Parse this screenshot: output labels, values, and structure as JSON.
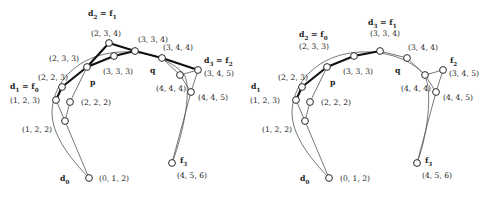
{
  "figure": {
    "title": "",
    "panels": [
      {
        "id": "left-panel",
        "name": "left-diagram",
        "origin_x": 0,
        "nodes": [
          {
            "id": "L-d0",
            "x": 89,
            "y": 178,
            "label": "(0, 1, 2)",
            "lx": 99,
            "ly": 175,
            "name": "node-0-1-2"
          },
          {
            "id": "L-122",
            "x": 65,
            "y": 121,
            "label": "(1, 2, 2)",
            "lx": 22,
            "ly": 126,
            "name": "node-1-2-2"
          },
          {
            "id": "L-d1",
            "x": 56,
            "y": 100,
            "label": "(1, 2, 3)",
            "lx": 10,
            "ly": 97,
            "name": "node-1-2-3"
          },
          {
            "id": "L-222",
            "x": 70,
            "y": 102,
            "label": "(2, 2, 2)",
            "lx": 81,
            "ly": 99,
            "name": "node-2-2-2"
          },
          {
            "id": "L-223",
            "x": 62,
            "y": 87,
            "label": "(2, 2, 3)",
            "lx": 38,
            "ly": 74,
            "name": "node-2-2-3"
          },
          {
            "id": "L-233",
            "x": 87,
            "y": 67,
            "label": "(2, 3, 3)",
            "lx": 49,
            "ly": 55,
            "name": "node-2-3-3"
          },
          {
            "id": "L-234",
            "x": 109,
            "y": 43,
            "label": "(2, 3, 4)",
            "lx": 91,
            "ly": 30,
            "name": "node-2-3-4"
          },
          {
            "id": "L-333",
            "x": 114,
            "y": 56,
            "label": "(3, 3, 3)",
            "lx": 103,
            "ly": 68,
            "name": "node-3-3-3"
          },
          {
            "id": "L-334",
            "x": 135,
            "y": 51,
            "label": "(3, 3, 4)",
            "lx": 138,
            "ly": 36,
            "name": "node-3-3-4"
          },
          {
            "id": "L-344",
            "x": 162,
            "y": 58,
            "label": "(3, 4, 4)",
            "lx": 163,
            "ly": 44,
            "name": "node-3-4-4"
          },
          {
            "id": "L-444",
            "x": 180,
            "y": 75,
            "label": "(4, 4, 4)",
            "lx": 156,
            "ly": 85,
            "name": "node-4-4-4"
          },
          {
            "id": "L-d3",
            "x": 198,
            "y": 70,
            "label": "(3, 4, 5)",
            "lx": 204,
            "ly": 70,
            "name": "node-3-4-5"
          },
          {
            "id": "L-445",
            "x": 191,
            "y": 92,
            "label": "(4, 4, 5)",
            "lx": 198,
            "ly": 94,
            "name": "node-4-4-5"
          },
          {
            "id": "L-f3",
            "x": 172,
            "y": 163,
            "label": "(4, 5, 6)",
            "lx": 177,
            "ly": 172,
            "name": "node-4-5-6"
          }
        ],
        "thin_edges": [
          [
            "L-d0",
            "L-122"
          ],
          [
            "L-122",
            "L-d1"
          ],
          [
            "L-122",
            "L-222"
          ],
          [
            "L-d1",
            "L-223"
          ],
          [
            "L-222",
            "L-233"
          ],
          [
            "L-233",
            "L-333"
          ],
          [
            "L-333",
            "L-334"
          ],
          [
            "L-334",
            "L-344"
          ],
          [
            "L-344",
            "L-444"
          ],
          [
            "L-444",
            "L-d3"
          ],
          [
            "L-444",
            "L-445"
          ],
          [
            "L-445",
            "L-d3"
          ],
          [
            "L-445",
            "L-f3"
          ]
        ],
        "thick_edges": [
          [
            "L-d1",
            "L-223"
          ],
          [
            "L-223",
            "L-233"
          ],
          [
            "L-233",
            "L-234"
          ],
          [
            "L-233",
            "L-333"
          ],
          [
            "L-234",
            "L-334"
          ],
          [
            "L-333",
            "L-334"
          ],
          [
            "L-334",
            "L-344"
          ],
          [
            "L-344",
            "L-d3"
          ]
        ],
        "curve": "M 89,178 C 62,150 48,126 53,103 C 58,78 78,60 105,54 C 134,48 165,55 183,73 C 193,84 184,132 172,163",
        "annotations": [
          {
            "text": "d₂ = f₁",
            "html": "<b>d</b><sub>2</sub> = <b>f</b><sub>1</sub>",
            "x": 88,
            "y": 10,
            "bold": true,
            "name": "label-d2-eq-f1"
          },
          {
            "text": "d₁ = f₀",
            "html": "<b>d</b><sub>1</sub> = <b>f</b><sub>0</sub>",
            "x": 10,
            "y": 83,
            "bold": true,
            "name": "label-d1-eq-f0"
          },
          {
            "text": "d₃ = f₂",
            "html": "<b>d</b><sub>3</sub> = <b>f</b><sub>2</sub>",
            "x": 204,
            "y": 57,
            "bold": true,
            "name": "label-d3-eq-f2"
          },
          {
            "text": "d₀",
            "html": "<b>d</b><sub>0</sub>",
            "x": 60,
            "y": 175,
            "bold": true,
            "name": "label-d0"
          },
          {
            "text": "f₃",
            "html": "<b>f</b><sub>3</sub>",
            "x": 180,
            "y": 157,
            "bold": true,
            "name": "label-f3"
          },
          {
            "text": "p",
            "html": "<b>p</b>",
            "x": 90,
            "y": 79,
            "bold": true,
            "name": "label-p"
          },
          {
            "text": "q",
            "html": "<b>q</b>",
            "x": 150,
            "y": 67,
            "bold": true,
            "name": "label-q"
          }
        ]
      },
      {
        "id": "right-panel",
        "name": "right-diagram",
        "origin_x": 245,
        "nodes": [
          {
            "id": "R-d0",
            "x": 329,
            "y": 178,
            "label": "(0, 1, 2)",
            "lx": 340,
            "ly": 175,
            "name": "node-0-1-2"
          },
          {
            "id": "R-122",
            "x": 305,
            "y": 121,
            "label": "(1, 2, 2)",
            "lx": 262,
            "ly": 126,
            "name": "node-1-2-2"
          },
          {
            "id": "R-d1",
            "x": 296,
            "y": 100,
            "label": "(1, 2, 3)",
            "lx": 250,
            "ly": 97,
            "name": "node-1-2-3"
          },
          {
            "id": "R-222",
            "x": 310,
            "y": 102,
            "label": "(2, 2, 2)",
            "lx": 321,
            "ly": 99,
            "name": "node-2-2-2"
          },
          {
            "id": "R-223",
            "x": 302,
            "y": 87,
            "label": "(2, 2, 3)",
            "lx": 278,
            "ly": 74,
            "name": "node-2-2-3"
          },
          {
            "id": "R-233",
            "x": 327,
            "y": 67,
            "label": "(2, 3, 3)",
            "lx": 299,
            "ly": 43,
            "name": "node-2-3-3"
          },
          {
            "id": "R-333",
            "x": 354,
            "y": 56,
            "label": "(3, 3, 3)",
            "lx": 343,
            "ly": 68,
            "name": "node-3-3-3"
          },
          {
            "id": "R-334",
            "x": 380,
            "y": 51,
            "label": "(3, 3, 4)",
            "lx": 370,
            "ly": 30,
            "name": "node-3-3-4"
          },
          {
            "id": "R-344",
            "x": 407,
            "y": 58,
            "label": "(3, 4, 4)",
            "lx": 408,
            "ly": 44,
            "name": "node-3-4-4"
          },
          {
            "id": "R-444",
            "x": 425,
            "y": 75,
            "label": "(4, 4, 4)",
            "lx": 401,
            "ly": 85,
            "name": "node-4-4-4"
          },
          {
            "id": "R-f2",
            "x": 443,
            "y": 70,
            "label": "(3, 4, 5)",
            "lx": 449,
            "ly": 70,
            "name": "node-3-4-5"
          },
          {
            "id": "R-445",
            "x": 436,
            "y": 92,
            "label": "(4, 4, 5)",
            "lx": 443,
            "ly": 94,
            "name": "node-4-4-5"
          },
          {
            "id": "R-f3",
            "x": 417,
            "y": 163,
            "label": "(4, 5, 6)",
            "lx": 422,
            "ly": 172,
            "name": "node-4-5-6"
          }
        ],
        "thin_edges": [
          [
            "R-d0",
            "R-122"
          ],
          [
            "R-122",
            "R-d1"
          ],
          [
            "R-122",
            "R-222"
          ],
          [
            "R-d1",
            "R-223"
          ],
          [
            "R-222",
            "R-233"
          ],
          [
            "R-233",
            "R-333"
          ],
          [
            "R-333",
            "R-334"
          ],
          [
            "R-334",
            "R-344"
          ],
          [
            "R-344",
            "R-444"
          ],
          [
            "R-444",
            "R-f2"
          ],
          [
            "R-444",
            "R-445"
          ],
          [
            "R-445",
            "R-f2"
          ],
          [
            "R-445",
            "R-f3"
          ]
        ],
        "thick_edges": [
          [
            "R-d1",
            "R-223"
          ],
          [
            "R-223",
            "R-233"
          ],
          [
            "R-233",
            "R-333"
          ],
          [
            "R-333",
            "R-334"
          ]
        ],
        "curve": "M 329,178 C 302,150 288,126 293,103 C 298,78 318,60 345,54 C 374,48 405,55 423,73 C 433,84 429,132 417,163",
        "annotations": [
          {
            "text": "d₂ = f₀",
            "html": "<b>d</b><sub>2</sub> = <b>f</b><sub>0</sub>",
            "x": 299,
            "y": 31,
            "bold": true,
            "name": "label-d2-eq-f0"
          },
          {
            "text": "d₃ = f₁",
            "html": "<b>d</b><sub>3</sub> = <b>f</b><sub>1</sub>",
            "x": 368,
            "y": 19,
            "bold": true,
            "name": "label-d3-eq-f1"
          },
          {
            "text": "d₁",
            "html": "<b>d</b><sub>1</sub>",
            "x": 251,
            "y": 83,
            "bold": true,
            "name": "label-d1"
          },
          {
            "text": "f₂",
            "html": "<b>f</b><sub>2</sub>",
            "x": 450,
            "y": 57,
            "bold": true,
            "name": "label-f2"
          },
          {
            "text": "d₀",
            "html": "<b>d</b><sub>0</sub>",
            "x": 300,
            "y": 175,
            "bold": true,
            "name": "label-d0"
          },
          {
            "text": "f₃",
            "html": "<b>f</b><sub>3</sub>",
            "x": 425,
            "y": 157,
            "bold": true,
            "name": "label-f3"
          },
          {
            "text": "p",
            "html": "<b>p</b>",
            "x": 330,
            "y": 79,
            "bold": true,
            "name": "label-p"
          },
          {
            "text": "q",
            "html": "<b>q</b>",
            "x": 395,
            "y": 67,
            "bold": true,
            "name": "label-q"
          }
        ]
      }
    ],
    "style": {
      "node_radius": 3.4,
      "node_fill": "#ffffff",
      "node_stroke": "#2a2a2a",
      "thin_edge_color": "#555555",
      "thick_edge_color": "#111111",
      "background": "#ffffff",
      "text_color": "#1d1d1d"
    }
  }
}
